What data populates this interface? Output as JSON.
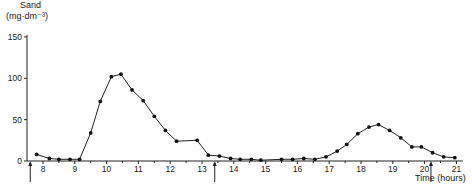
{
  "chart_data": {
    "type": "line",
    "title": "",
    "ylabel": "Sand",
    "yunit": "(mg·dm⁻³)",
    "xlabel": "Time (hours)",
    "ylim": [
      0,
      150
    ],
    "xlim": [
      7.6,
      21.2
    ],
    "yticks": [
      0,
      50,
      100,
      150
    ],
    "xticks": [
      8,
      9,
      10,
      11,
      12,
      13,
      14,
      15,
      16,
      17,
      18,
      19,
      20,
      21
    ],
    "grid": false,
    "legend": null,
    "markers": "filled-circle",
    "arrows_at": [
      7.6,
      13.4,
      20.2
    ],
    "series": [
      {
        "name": "Sand",
        "x": [
          7.8,
          8.2,
          8.5,
          8.85,
          9.15,
          9.5,
          9.8,
          10.15,
          10.45,
          10.8,
          11.15,
          11.5,
          11.85,
          12.2,
          12.85,
          13.2,
          13.55,
          13.9,
          14.2,
          14.55,
          14.85,
          15.5,
          15.85,
          16.2,
          16.55,
          16.9,
          17.25,
          17.55,
          17.9,
          18.25,
          18.55,
          18.9,
          19.25,
          19.6,
          19.9,
          20.25,
          20.6,
          20.95
        ],
        "values": [
          8,
          3,
          2,
          2,
          2,
          34,
          72,
          102,
          105,
          86,
          73,
          54,
          37,
          24,
          25,
          7,
          6,
          3,
          2,
          2,
          1,
          2,
          2,
          3,
          2,
          5,
          12,
          20,
          33,
          41,
          44,
          37,
          28,
          17,
          17,
          10,
          5,
          4
        ]
      }
    ]
  },
  "labels": {
    "ylabel": "Sand",
    "yunit": "(mg·dm⁻³)",
    "xlabel": "Time (hours)"
  }
}
